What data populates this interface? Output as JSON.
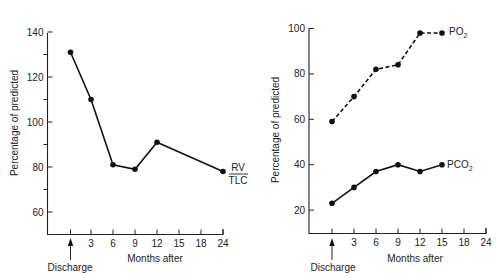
{
  "chart_data": [
    {
      "type": "line",
      "title": "",
      "xlabel": "Months after",
      "ylabel": "Percentage of predicted",
      "x_ticks": [
        "",
        "3",
        "6",
        "9",
        "12",
        "15",
        "18",
        "24"
      ],
      "x_annotation": "Discharge",
      "y_ticks": [
        60,
        80,
        100,
        120,
        140
      ],
      "ylim": [
        50,
        140
      ],
      "grid": false,
      "series": [
        {
          "name": "RV/TLC",
          "label_top": "RV",
          "label_bottom": "TLC",
          "style": "solid",
          "x": [
            "Discharge",
            3,
            6,
            9,
            12,
            24
          ],
          "values": [
            131,
            110,
            81,
            79,
            91,
            78
          ]
        }
      ]
    },
    {
      "type": "line",
      "title": "",
      "xlabel": "Months after",
      "ylabel": "Percentage of predicted",
      "x_ticks": [
        "",
        "3",
        "6",
        "9",
        "12",
        "15",
        "18",
        "24"
      ],
      "x_annotation": "Discharge",
      "y_ticks": [
        20,
        40,
        60,
        80,
        100
      ],
      "ylim": [
        10,
        100
      ],
      "grid": false,
      "series": [
        {
          "name": "PO2",
          "label_main": "PO",
          "label_sub": "2",
          "style": "dashed",
          "x": [
            "Discharge",
            3,
            6,
            9,
            12,
            15
          ],
          "values": [
            59,
            70,
            82,
            84,
            98,
            98
          ]
        },
        {
          "name": "PCO2",
          "label_main": "PCO",
          "label_sub": "2",
          "style": "solid",
          "x": [
            "Discharge",
            3,
            6,
            9,
            12,
            15
          ],
          "values": [
            23,
            30,
            37,
            40,
            37,
            40
          ]
        }
      ]
    }
  ]
}
